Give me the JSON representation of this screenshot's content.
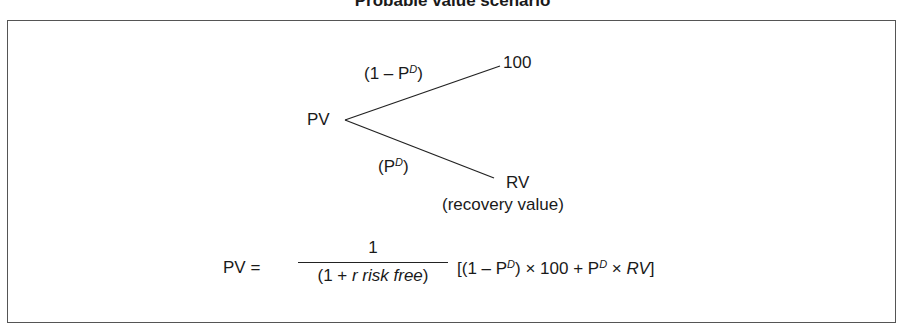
{
  "title": "Probable value scenario",
  "tree": {
    "root": "PV",
    "upper_branch_label_prefix": "(1 – P",
    "upper_branch_sup": "D",
    "upper_branch_suffix": ")",
    "upper_outcome": "100",
    "lower_branch_prefix": "(P",
    "lower_branch_sup": "D",
    "lower_branch_suffix": ")",
    "lower_outcome": "RV",
    "lower_outcome_note": "(recovery  value)"
  },
  "formula": {
    "lhs": "PV =",
    "numerator": "1",
    "denominator_prefix": "(1 + ",
    "denominator_italic": "r risk free",
    "denominator_suffix": ")",
    "bracket_part1": "[(1 – P",
    "sup1": "D",
    "bracket_part2": ") × 100 + P",
    "sup2": "D",
    "bracket_part3": " × ",
    "bracket_italic": "RV",
    "bracket_part4": "]"
  },
  "colors": {
    "line": "#222222",
    "frame": "#555555"
  }
}
